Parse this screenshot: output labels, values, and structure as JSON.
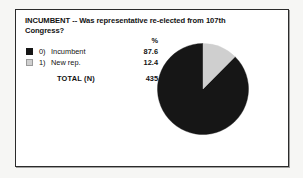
{
  "figure": {
    "title": "INCUMBENT -- Was representative re-elected from 107th Congress?",
    "percent_header": "%",
    "total_label": "TOTAL  (N)",
    "total_value": "435",
    "rows": [
      {
        "index": "0)",
        "label": "Incumbent",
        "value": "87.6",
        "swatch": "dark-square-icon",
        "color": "#161616"
      },
      {
        "index": "1)",
        "label": "New rep.",
        "value": "12.4",
        "swatch": "light-square-icon",
        "color": "#cfcfcf"
      }
    ]
  },
  "chart_data": {
    "type": "pie",
    "title": "INCUMBENT -- Was representative re-elected from 107th Congress?",
    "categories": [
      "0) Incumbent",
      "1) New rep."
    ],
    "values": [
      87.6,
      12.4
    ],
    "unit": "percent",
    "colors": [
      "#161616",
      "#cfcfcf"
    ],
    "total_n": 435,
    "legend_position": "left",
    "grid": false,
    "start_angle_deg": 0,
    "direction": "counter-clockwise",
    "labels": [
      "87.6",
      "12.4"
    ]
  }
}
